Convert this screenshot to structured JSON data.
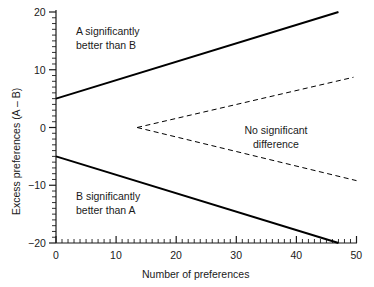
{
  "chart_data": {
    "type": "line",
    "title": "",
    "xlabel": "Number of preferences",
    "ylabel": "Excess preferences (A – B)",
    "xlim": [
      0,
      50
    ],
    "ylim": [
      -20,
      20
    ],
    "xticks": [
      0,
      10,
      20,
      30,
      40,
      50
    ],
    "xtick_labels": [
      "0",
      "10",
      "20",
      "30",
      "40",
      "50"
    ],
    "yticks": [
      -20,
      -10,
      0,
      10,
      20
    ],
    "ytick_labels": [
      "−20",
      "−10",
      "0",
      "10",
      "20"
    ],
    "x_minor_tick_step": 1,
    "y_minor_tick_step": 1,
    "grid": false,
    "legend": "none",
    "series": [
      {
        "name": "Upper significance boundary",
        "style": "solid",
        "color": "#000000",
        "width": 2,
        "x": [
          0,
          47
        ],
        "values": [
          5,
          20
        ]
      },
      {
        "name": "Lower significance boundary",
        "style": "solid",
        "color": "#000000",
        "width": 2,
        "x": [
          0,
          47
        ],
        "values": [
          -5,
          -20
        ]
      },
      {
        "name": "Upper no-difference boundary",
        "style": "dashed",
        "color": "#000000",
        "width": 1,
        "x": [
          13.5,
          49.5
        ],
        "values": [
          0,
          8.7
        ]
      },
      {
        "name": "Lower no-difference boundary",
        "style": "dashed",
        "color": "#000000",
        "width": 1,
        "x": [
          13.5,
          50
        ],
        "values": [
          0,
          -9.2
        ]
      }
    ],
    "annotations": [
      {
        "id": "a-better",
        "text": "A significantly\nbetter than B",
        "x": 7,
        "y": 16
      },
      {
        "id": "b-better",
        "text": "B significantly\nbetter than A",
        "x": 7,
        "y": -11
      },
      {
        "id": "no-diff",
        "text": "No significant\ndifference",
        "x": 37,
        "y": 0.5
      }
    ]
  }
}
